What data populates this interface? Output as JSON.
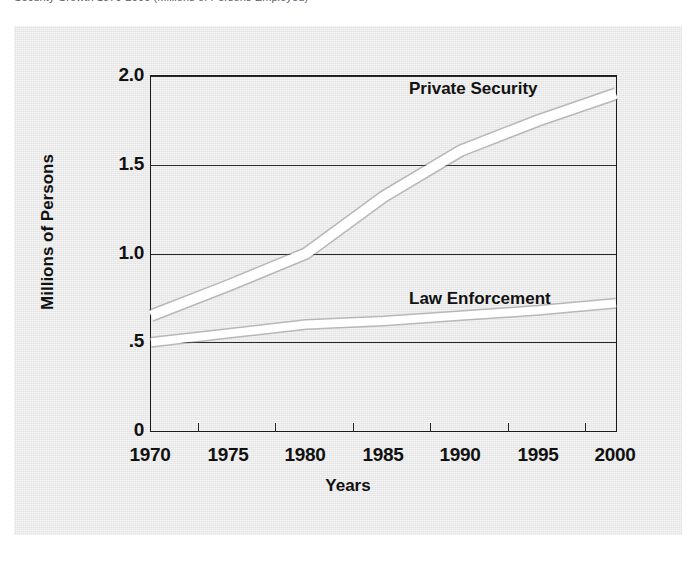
{
  "caption": {
    "text": "Security Growth 1970-2000 (Millions of Persons Employed)"
  },
  "chart_data": {
    "type": "line",
    "title": "",
    "xlabel": "Years",
    "ylabel": "Millions of Persons",
    "x": [
      1970,
      1975,
      1980,
      1985,
      1990,
      1995,
      2000
    ],
    "xlim": [
      1970,
      2000
    ],
    "ylim": [
      0,
      2.0
    ],
    "ytick_labels": [
      "0",
      ".5",
      "1.0",
      "1.5",
      "2.0"
    ],
    "ytick_values": [
      0,
      0.5,
      1.0,
      1.5,
      2.0
    ],
    "xtick_labels": [
      "1970",
      "1975",
      "1980",
      "1985",
      "1990",
      "1995",
      "2000"
    ],
    "grid": true,
    "legend": "inline-annotations",
    "line_color": "#ffffff",
    "panel_color": "#e3e3e3",
    "axis_color": "#1c1c1c",
    "series": [
      {
        "name": "Private Security",
        "values": [
          0.65,
          0.82,
          1.0,
          1.32,
          1.58,
          1.75,
          1.9
        ]
      },
      {
        "name": "Law Enforcement",
        "values": [
          0.5,
          0.55,
          0.6,
          0.62,
          0.65,
          0.68,
          0.72
        ]
      }
    ]
  },
  "annotations": {
    "private_security": "Private Security",
    "law_enforcement": "Law Enforcement"
  },
  "axes": {
    "y_title": "Millions of Persons",
    "x_title": "Years",
    "y_ticks": [
      "2.0",
      "1.5",
      "1.0",
      ".5",
      "0"
    ],
    "x_ticks": [
      "1970",
      "1975",
      "1980",
      "1985",
      "1990",
      "1995",
      "2000"
    ]
  }
}
